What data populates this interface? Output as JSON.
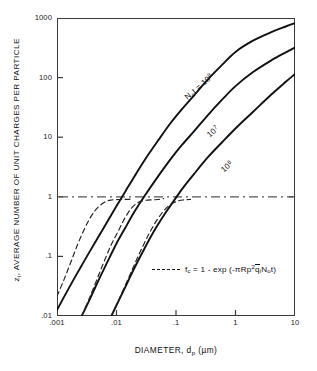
{
  "chart_data": {
    "type": "line",
    "title": "",
    "xlabel": "DIAMETER, d_p (µm)",
    "ylabel": "z_i, AVERAGE NUMBER OF UNIT CHARGES PER PARTICLE",
    "xscale": "log",
    "yscale": "log",
    "xlim": [
      0.001,
      10
    ],
    "ylim": [
      0.01,
      1000
    ],
    "grid": false,
    "legend_position": "inside-lower-right",
    "x_tick_labels": [
      ".001",
      ".01",
      ".1",
      "1",
      "10"
    ],
    "x_tick_values": [
      0.001,
      0.01,
      0.1,
      1,
      10
    ],
    "y_tick_labels": [
      ".01",
      ".1",
      "1",
      "10",
      "100",
      "1000"
    ],
    "y_tick_values": [
      0.01,
      0.1,
      1,
      10,
      100,
      1000
    ],
    "reference_line": {
      "name": "z-equals-one",
      "orientation": "horizontal",
      "y": 1,
      "style": "dash-dot",
      "color": "#555555"
    },
    "series": [
      {
        "name": "Not = 10^8",
        "label": "Nₒt = 10⁸",
        "style": "solid",
        "color": "#111111",
        "points": [
          [
            0.001,
            0.0126
          ],
          [
            0.0013,
            0.0205
          ],
          [
            0.0018,
            0.037
          ],
          [
            0.0025,
            0.066
          ],
          [
            0.0035,
            0.118
          ],
          [
            0.005,
            0.215
          ],
          [
            0.007,
            0.38
          ],
          [
            0.01,
            0.7
          ],
          [
            0.014,
            1.22
          ],
          [
            0.02,
            2.2
          ],
          [
            0.03,
            4.2
          ],
          [
            0.05,
            8.8
          ],
          [
            0.08,
            17.0
          ],
          [
            0.12,
            28.0
          ],
          [
            0.2,
            50.0
          ],
          [
            0.35,
            95.0
          ],
          [
            0.6,
            165.0
          ],
          [
            1.0,
            270.0
          ],
          [
            2.0,
            420.0
          ],
          [
            4.0,
            580.0
          ],
          [
            7.0,
            720.0
          ],
          [
            10.0,
            820.0
          ]
        ]
      },
      {
        "name": "Not = 10^7",
        "label": "10⁷",
        "style": "solid",
        "color": "#111111",
        "points": [
          [
            0.0026,
            0.01
          ],
          [
            0.0035,
            0.0185
          ],
          [
            0.005,
            0.04
          ],
          [
            0.007,
            0.08
          ],
          [
            0.01,
            0.165
          ],
          [
            0.014,
            0.3
          ],
          [
            0.02,
            0.56
          ],
          [
            0.03,
            1.05
          ],
          [
            0.05,
            2.2
          ],
          [
            0.08,
            4.2
          ],
          [
            0.12,
            7.0
          ],
          [
            0.2,
            12.5
          ],
          [
            0.35,
            24.0
          ],
          [
            0.6,
            43.0
          ],
          [
            1.0,
            72.0
          ],
          [
            2.0,
            125.0
          ],
          [
            4.0,
            195.0
          ],
          [
            7.0,
            265.0
          ],
          [
            10.0,
            320.0
          ]
        ]
      },
      {
        "name": "Not = 10^6",
        "label": "10⁶",
        "style": "solid",
        "color": "#111111",
        "points": [
          [
            0.0082,
            0.01
          ],
          [
            0.011,
            0.0185
          ],
          [
            0.015,
            0.035
          ],
          [
            0.02,
            0.064
          ],
          [
            0.03,
            0.14
          ],
          [
            0.045,
            0.29
          ],
          [
            0.065,
            0.52
          ],
          [
            0.09,
            0.83
          ],
          [
            0.13,
            1.4
          ],
          [
            0.2,
            2.4
          ],
          [
            0.35,
            4.7
          ],
          [
            0.6,
            8.3
          ],
          [
            1.0,
            14.0
          ],
          [
            2.0,
            27.0
          ],
          [
            4.0,
            52.0
          ],
          [
            7.0,
            85.0
          ],
          [
            10.0,
            115.0
          ]
        ]
      },
      {
        "name": "fc saturation for Not = 10^8",
        "label": "",
        "style": "dashed",
        "color": "#222222",
        "points": [
          [
            0.001,
            0.0215
          ],
          [
            0.0013,
            0.04
          ],
          [
            0.0017,
            0.079
          ],
          [
            0.0022,
            0.155
          ],
          [
            0.0028,
            0.27
          ],
          [
            0.0035,
            0.42
          ],
          [
            0.0045,
            0.61
          ],
          [
            0.006,
            0.79
          ],
          [
            0.008,
            0.88
          ],
          [
            0.011,
            0.9
          ],
          [
            0.015,
            0.905
          ],
          [
            0.019,
            0.93
          ]
        ]
      },
      {
        "name": "fc saturation for Not = 10^7",
        "label": "",
        "style": "dashed",
        "color": "#222222",
        "points": [
          [
            0.0026,
            0.01
          ],
          [
            0.0034,
            0.0185
          ],
          [
            0.0045,
            0.037
          ],
          [
            0.006,
            0.076
          ],
          [
            0.008,
            0.15
          ],
          [
            0.011,
            0.28
          ],
          [
            0.014,
            0.45
          ],
          [
            0.018,
            0.65
          ],
          [
            0.023,
            0.8
          ],
          [
            0.03,
            0.87
          ],
          [
            0.04,
            0.89
          ],
          [
            0.05,
            0.9
          ],
          [
            0.062,
            0.93
          ]
        ]
      },
      {
        "name": "fc saturation for Not = 10^6",
        "label": "",
        "style": "dashed",
        "color": "#222222",
        "points": [
          [
            0.0082,
            0.01
          ],
          [
            0.011,
            0.019
          ],
          [
            0.015,
            0.038
          ],
          [
            0.02,
            0.073
          ],
          [
            0.027,
            0.14
          ],
          [
            0.036,
            0.25
          ],
          [
            0.048,
            0.41
          ],
          [
            0.063,
            0.59
          ],
          [
            0.082,
            0.75
          ],
          [
            0.11,
            0.855
          ],
          [
            0.14,
            0.89
          ],
          [
            0.175,
            0.905
          ]
        ]
      }
    ],
    "annotations": [
      {
        "name": "legend-equation",
        "text": "f_c = 1 - exp (-πR_p² q̄_i N_o t)"
      }
    ]
  },
  "axes": {
    "y_title_main": ", AVERAGE NUMBER OF UNIT CHARGES  PER PARTICLE",
    "y_title_symbol": "z",
    "y_title_symbol_sub": "i",
    "x_title_prefix": "DIAMETER, d",
    "x_title_sub": "p",
    "x_title_unit": "(µm)"
  },
  "curve_labels": [
    {
      "prefix": "N",
      "sub": "o",
      "mid": "t = 10",
      "sup": "8"
    },
    {
      "prefix": "",
      "sub": "",
      "mid": "10",
      "sup": "7"
    },
    {
      "prefix": "",
      "sub": "",
      "mid": "10",
      "sup": "6"
    }
  ],
  "legend": {
    "eq_fc": "f",
    "eq_fc_sub": "c",
    "eq_body1": " = 1 - exp (-πR",
    "eq_rp_sub": "p",
    "eq_rp_sup": "2",
    "eq_q": "q",
    "eq_q_sub": "i",
    "eq_n": "N",
    "eq_n_sub": "o",
    "eq_t": "t)"
  }
}
